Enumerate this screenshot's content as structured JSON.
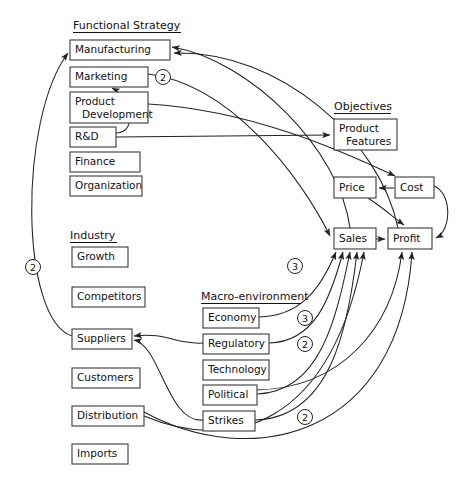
{
  "diagram": {
    "groups": [
      {
        "id": "functional-strategy",
        "label": "Functional Strategy",
        "label_x": 73,
        "label_y": 29,
        "rule_w": 108,
        "nodes": [
          {
            "id": "manufacturing",
            "label": "Manufacturing",
            "x": 70,
            "y": 40,
            "w": 100,
            "h": 20
          },
          {
            "id": "marketing",
            "label": "Marketing",
            "x": 70,
            "y": 67,
            "w": 78,
            "h": 20
          },
          {
            "id": "product-development",
            "label": "Product\nDevelopment",
            "x": 70,
            "y": 92,
            "w": 78,
            "h": 31
          },
          {
            "id": "rd",
            "label": "R&D",
            "x": 70,
            "y": 127,
            "w": 46,
            "h": 20
          },
          {
            "id": "finance",
            "label": "Finance",
            "x": 70,
            "y": 152,
            "w": 70,
            "h": 20
          },
          {
            "id": "organization",
            "label": "Organization",
            "x": 70,
            "y": 176,
            "w": 72,
            "h": 20
          }
        ]
      },
      {
        "id": "industry",
        "label": "Industry",
        "label_x": 70,
        "label_y": 239,
        "rule_w": 47,
        "nodes": [
          {
            "id": "growth",
            "label": "Growth",
            "x": 72,
            "y": 247,
            "w": 56,
            "h": 20
          },
          {
            "id": "competitors",
            "label": "Competitors",
            "x": 72,
            "y": 287,
            "w": 73,
            "h": 20
          },
          {
            "id": "suppliers",
            "label": "Suppliers",
            "x": 72,
            "y": 329,
            "w": 60,
            "h": 20
          },
          {
            "id": "customers",
            "label": "Customers",
            "x": 72,
            "y": 368,
            "w": 68,
            "h": 20
          },
          {
            "id": "distribution",
            "label": "Distribution",
            "x": 72,
            "y": 406,
            "w": 72,
            "h": 20
          },
          {
            "id": "imports",
            "label": "Imports",
            "x": 72,
            "y": 444,
            "w": 56,
            "h": 20
          }
        ]
      },
      {
        "id": "macro-environment",
        "label": "Macro-environment",
        "label_x": 201,
        "label_y": 300,
        "rule_w": 100,
        "nodes": [
          {
            "id": "economy",
            "label": "Economy",
            "x": 203,
            "y": 308,
            "w": 56,
            "h": 20
          },
          {
            "id": "regulatory",
            "label": "Regulatory",
            "x": 203,
            "y": 334,
            "w": 66,
            "h": 20
          },
          {
            "id": "technology",
            "label": "Technology",
            "x": 203,
            "y": 360,
            "w": 66,
            "h": 20
          },
          {
            "id": "political",
            "label": "Political",
            "x": 203,
            "y": 385,
            "w": 54,
            "h": 20
          },
          {
            "id": "strikes",
            "label": "Strikes",
            "x": 203,
            "y": 411,
            "w": 52,
            "h": 20
          }
        ]
      },
      {
        "id": "objectives",
        "label": "Objectives",
        "label_x": 334,
        "label_y": 110,
        "rule_w": 57,
        "nodes": [
          {
            "id": "product-features",
            "label": "Product\nFeatures",
            "x": 334,
            "y": 119,
            "w": 63,
            "h": 31
          },
          {
            "id": "price",
            "label": "Price",
            "x": 334,
            "y": 177,
            "w": 42,
            "h": 21
          },
          {
            "id": "cost",
            "label": "Cost",
            "x": 395,
            "y": 177,
            "w": 39,
            "h": 21
          },
          {
            "id": "sales",
            "label": "Sales",
            "x": 334,
            "y": 228,
            "w": 42,
            "h": 21
          },
          {
            "id": "profit",
            "label": "Profit",
            "x": 388,
            "y": 228,
            "w": 44,
            "h": 21
          }
        ]
      }
    ],
    "badges": [
      {
        "id": "badge-suppliers-manufacturing",
        "value": "2",
        "x": 33,
        "y": 267
      },
      {
        "id": "badge-marketing-manufacturing",
        "value": "2",
        "x": 163,
        "y": 77
      },
      {
        "id": "badge-sales-feedback",
        "value": "3",
        "x": 295,
        "y": 266
      },
      {
        "id": "badge-economy-sales",
        "value": "3",
        "x": 305,
        "y": 318
      },
      {
        "id": "badge-regulatory-sales",
        "value": "2",
        "x": 305,
        "y": 344
      },
      {
        "id": "badge-strikes-sales",
        "value": "2",
        "x": 305,
        "y": 417
      }
    ],
    "edges": [
      {
        "id": "edge-rd-product-features",
        "from": "rd",
        "to": "product-features"
      },
      {
        "id": "edge-rd-marketing",
        "from": "rd",
        "to": "marketing"
      },
      {
        "id": "edge-product-development-cost",
        "from": "product-development",
        "to": "cost"
      },
      {
        "id": "edge-marketing-sales",
        "from": "marketing",
        "to": "sales"
      },
      {
        "id": "edge-cost-price",
        "from": "cost",
        "to": "price"
      },
      {
        "id": "edge-cost-profit",
        "from": "cost",
        "to": "profit"
      },
      {
        "id": "edge-price-profit",
        "from": "price",
        "to": "profit"
      },
      {
        "id": "edge-sales-profit",
        "from": "sales",
        "to": "profit"
      },
      {
        "id": "edge-suppliers-manufacturing",
        "from": "suppliers",
        "to": "manufacturing"
      },
      {
        "id": "edge-regulatory-suppliers",
        "from": "regulatory",
        "to": "suppliers"
      },
      {
        "id": "edge-strikes-suppliers",
        "from": "strikes",
        "to": "suppliers"
      },
      {
        "id": "edge-economy-sales",
        "from": "economy",
        "to": "sales"
      },
      {
        "id": "edge-regulatory-sales",
        "from": "regulatory",
        "to": "sales"
      },
      {
        "id": "edge-political-sales",
        "from": "political",
        "to": "sales"
      },
      {
        "id": "edge-strikes-sales",
        "from": "strikes",
        "to": "sales"
      },
      {
        "id": "edge-distribution-sales",
        "from": "distribution",
        "to": "sales"
      },
      {
        "id": "edge-sales-manufacturing",
        "from": "sales",
        "to": "manufacturing"
      },
      {
        "id": "edge-profit-manufacturing",
        "from": "profit",
        "to": "manufacturing"
      },
      {
        "id": "edge-political-profit",
        "from": "political",
        "to": "profit"
      },
      {
        "id": "edge-distribution-profit",
        "from": "distribution",
        "to": "profit"
      }
    ]
  }
}
